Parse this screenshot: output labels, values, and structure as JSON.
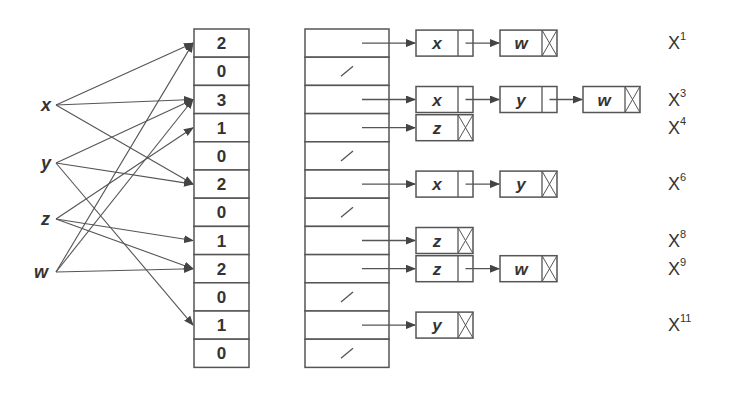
{
  "diagram": {
    "variables": [
      {
        "name": "x",
        "targets": [
          1,
          3,
          6
        ]
      },
      {
        "name": "y",
        "targets": [
          3,
          6,
          11
        ]
      },
      {
        "name": "z",
        "targets": [
          4,
          8,
          9
        ]
      },
      {
        "name": "w",
        "targets": [
          1,
          3,
          9
        ]
      }
    ],
    "counts": [
      "2",
      "0",
      "3",
      "1",
      "0",
      "2",
      "0",
      "1",
      "2",
      "0",
      "1",
      "0"
    ],
    "buckets": [
      {
        "index": 1,
        "nodes": [
          "x",
          "w"
        ],
        "label": "X",
        "exp": "1"
      },
      {
        "index": 2,
        "nodes": []
      },
      {
        "index": 3,
        "nodes": [
          "x",
          "y",
          "w"
        ],
        "label": "X",
        "exp": "3"
      },
      {
        "index": 4,
        "nodes": [
          "z"
        ],
        "label": "X",
        "exp": "4"
      },
      {
        "index": 5,
        "nodes": []
      },
      {
        "index": 6,
        "nodes": [
          "x",
          "y"
        ],
        "label": "X",
        "exp": "6"
      },
      {
        "index": 7,
        "nodes": []
      },
      {
        "index": 8,
        "nodes": [
          "z"
        ],
        "label": "X",
        "exp": "8"
      },
      {
        "index": 9,
        "nodes": [
          "z",
          "w"
        ],
        "label": "X",
        "exp": "9"
      },
      {
        "index": 10,
        "nodes": []
      },
      {
        "index": 11,
        "nodes": [
          "y"
        ],
        "label": "X",
        "exp": "11"
      },
      {
        "index": 12,
        "nodes": []
      }
    ],
    "colors": {
      "stroke": "#555555",
      "text": "#333333",
      "background": "#ffffff"
    }
  }
}
